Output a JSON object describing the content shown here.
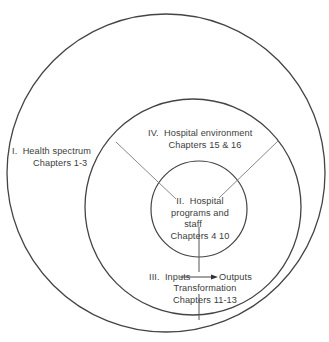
{
  "diagram": {
    "regions": [
      {
        "id": "I",
        "numeral": "I.",
        "title": "Health spectrum",
        "chapters": "Chapters 1-3"
      },
      {
        "id": "II",
        "numeral": "II.",
        "title": "Hospital",
        "title_line2": "programs and",
        "title_line3": "staff",
        "chapters": "Chapters 4 10"
      },
      {
        "id": "III",
        "numeral": "III.",
        "input_label": "Inputs",
        "output_label": "Outputs",
        "process_label": "Transformation",
        "chapters": "Chapters 11-13"
      },
      {
        "id": "IV",
        "numeral": "IV.",
        "title": "Hospital environment",
        "chapters": "Chapters 15 & 16"
      }
    ],
    "colors": {
      "stroke": "#444444",
      "spoke": "#888888",
      "text": "#3c3c3c",
      "background": "#ffffff"
    }
  }
}
